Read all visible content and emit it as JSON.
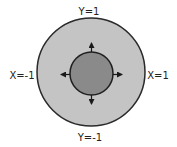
{
  "diagram": {
    "labels": {
      "top": "Y=1",
      "bottom": "Y=-1",
      "left": "X=-1",
      "right": "X=1"
    },
    "outer_circle": {
      "cx": 91,
      "cy": 72,
      "r": 54,
      "fill": "#c4c4c4",
      "stroke": "#2a2a2a"
    },
    "inner_circle": {
      "cx": 91.5,
      "cy": 73.5,
      "r": 21.5,
      "fill": "#8a8a8a",
      "stroke": "#2a2a2a"
    },
    "arrows": [
      "up",
      "down",
      "left",
      "right"
    ]
  }
}
